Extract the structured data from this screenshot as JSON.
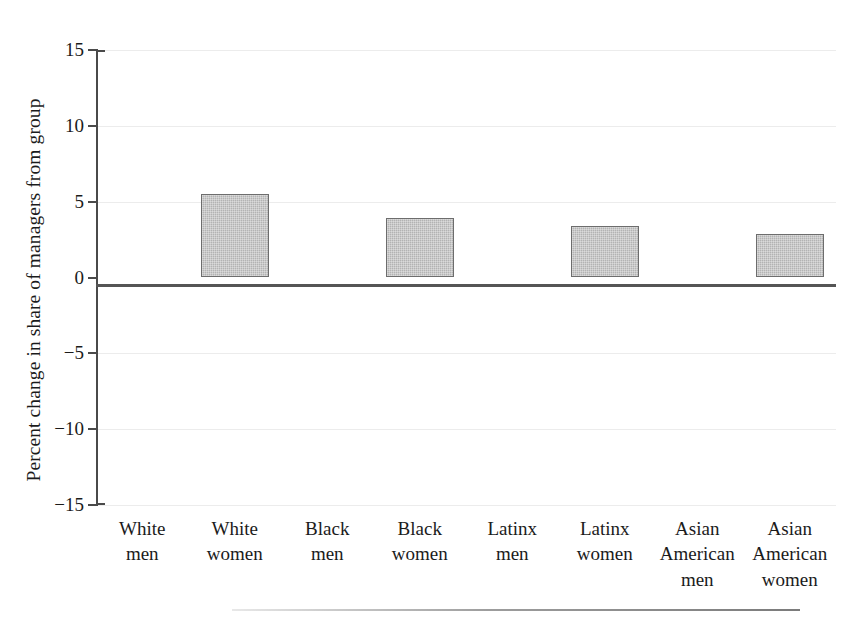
{
  "chart_data": {
    "type": "bar",
    "title": "",
    "subtitle": "",
    "xlabel": "",
    "ylabel": "Percent change in share of managers from group",
    "categories": [
      "White men",
      "White women",
      "Black men",
      "Black women",
      "Latinx men",
      "Latinx women",
      "Asian American men",
      "Asian American women"
    ],
    "category_lines": [
      [
        "White",
        "men"
      ],
      [
        "White",
        "women"
      ],
      [
        "Black",
        "men"
      ],
      [
        "Black",
        "women"
      ],
      [
        "Latinx",
        "men"
      ],
      [
        "Latinx",
        "women"
      ],
      [
        "Asian",
        "American",
        "men"
      ],
      [
        "Asian",
        "American",
        "women"
      ]
    ],
    "values": [
      0,
      5.5,
      0,
      3.9,
      0,
      3.4,
      0,
      2.9
    ],
    "ylim": [
      -15,
      15
    ],
    "ytick_labels": [
      "15",
      "10",
      "5",
      "0",
      "−5",
      "−10",
      "−15"
    ],
    "ytick_values": [
      15,
      10,
      5,
      0,
      -5,
      -10,
      -15
    ],
    "grid": true,
    "legend": "none",
    "bar_fill_color": "#b3b3b3",
    "bar_border_color": "#6d6d6d",
    "axis_color": "#4a4a4a",
    "gridline_color": "#ececec",
    "background_color": "#ffffff"
  },
  "figure": {
    "bottom_rule_visible": true
  }
}
